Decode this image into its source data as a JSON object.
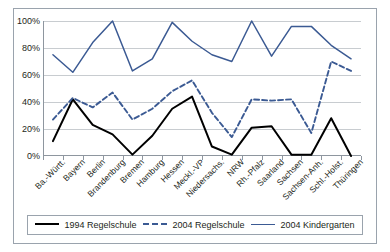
{
  "chart_data": {
    "type": "line",
    "title": "",
    "xlabel": "",
    "ylabel": "",
    "ylim": [
      0,
      100
    ],
    "ytick_labels": [
      "0%",
      "20%",
      "40%",
      "60%",
      "80%",
      "100%"
    ],
    "ytick_values": [
      0,
      20,
      40,
      60,
      80,
      100
    ],
    "grid": true,
    "legend_position": "bottom",
    "categories": [
      "Ba.-Württ.",
      "Bayern",
      "Berlin",
      "Brandenburg",
      "Bremen",
      "Hamburg",
      "Hessen",
      "Meckl.-VP",
      "Niedersachs.",
      "NRW",
      "Rh.-Pfalz",
      "Saarland",
      "Sachsen",
      "Sachsen-Anh.",
      "Schl.-Holst.",
      "Thüringen"
    ],
    "series": [
      {
        "name": "1994 Regelschule",
        "style": "solid",
        "color": "#000000",
        "values": [
          11,
          42,
          23,
          16,
          1,
          15,
          35,
          44,
          7,
          1,
          21,
          22,
          1,
          1,
          28,
          0
        ]
      },
      {
        "name": "2004 Regelschule",
        "style": "dashed",
        "color": "#3b5a93",
        "values": [
          27,
          43,
          36,
          47,
          27,
          35,
          48,
          56,
          32,
          14,
          42,
          41,
          42,
          17,
          70,
          63
        ]
      },
      {
        "name": "2004 Kindergarten",
        "style": "solid",
        "color": "#3b5a93",
        "values": [
          75,
          62,
          84,
          100,
          63,
          72,
          99,
          85,
          75,
          70,
          100,
          74,
          96,
          96,
          82,
          72
        ]
      }
    ]
  },
  "legend": {
    "items": [
      {
        "label": "1994 Regelschule"
      },
      {
        "label": "2004 Regelschule"
      },
      {
        "label": "2004 Kindergarten"
      }
    ]
  }
}
